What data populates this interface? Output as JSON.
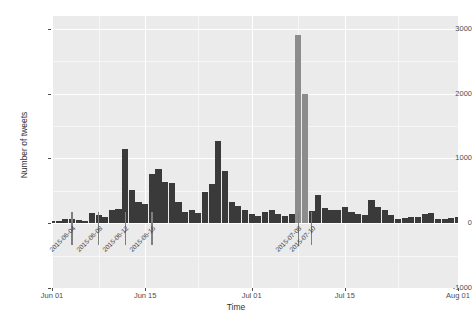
{
  "chart_data": {
    "type": "bar",
    "title": "",
    "subtitle": "",
    "xlabel": "Time",
    "ylabel": "Number of tweets",
    "grid": true,
    "legend": "none",
    "xlim": [
      "2015-06-01",
      "2015-08-01"
    ],
    "ylim": [
      -1000,
      3200
    ],
    "y_ticks": [
      3000,
      2000,
      1000,
      0,
      -1000
    ],
    "y_tick_labels": [
      "3000",
      "2000",
      "1000",
      "0",
      "-1000"
    ],
    "x_ticks": [
      "2015-06-01",
      "2015-06-15",
      "2015-07-01",
      "2015-07-15",
      "2015-08-01"
    ],
    "x_tick_labels": [
      "Jun 01",
      "Jun 15",
      "Jul 01",
      "Jul 15",
      "Aug 01"
    ],
    "bar_color": "#3a3a3a",
    "panel_color": "#ebebeb",
    "grid_color": "#ffffff",
    "categories": [
      "2015-06-01",
      "2015-06-02",
      "2015-06-03",
      "2015-06-04",
      "2015-06-05",
      "2015-06-06",
      "2015-06-07",
      "2015-06-08",
      "2015-06-09",
      "2015-06-10",
      "2015-06-11",
      "2015-06-12",
      "2015-06-13",
      "2015-06-14",
      "2015-06-15",
      "2015-06-16",
      "2015-06-17",
      "2015-06-18",
      "2015-06-19",
      "2015-06-20",
      "2015-06-21",
      "2015-06-22",
      "2015-06-23",
      "2015-06-24",
      "2015-06-25",
      "2015-06-26",
      "2015-06-27",
      "2015-06-28",
      "2015-06-29",
      "2015-06-30",
      "2015-07-01",
      "2015-07-02",
      "2015-07-03",
      "2015-07-04",
      "2015-07-05",
      "2015-07-06",
      "2015-07-07",
      "2015-07-08",
      "2015-07-09",
      "2015-07-10",
      "2015-07-11",
      "2015-07-12",
      "2015-07-13",
      "2015-07-14",
      "2015-07-15",
      "2015-07-16",
      "2015-07-17",
      "2015-07-18",
      "2015-07-19",
      "2015-07-20",
      "2015-07-21",
      "2015-07-22",
      "2015-07-23",
      "2015-07-24",
      "2015-07-25",
      "2015-07-26",
      "2015-07-27",
      "2015-07-28",
      "2015-07-29",
      "2015-07-30",
      "2015-07-31",
      "2015-08-01"
    ],
    "values": [
      30,
      35,
      60,
      70,
      55,
      40,
      160,
      130,
      95,
      200,
      220,
      1140,
      520,
      330,
      290,
      760,
      840,
      640,
      620,
      330,
      180,
      200,
      160,
      480,
      600,
      1270,
      800,
      330,
      260,
      210,
      150,
      110,
      180,
      200,
      140,
      110,
      150,
      2900,
      2000,
      195,
      440,
      230,
      200,
      210,
      250,
      170,
      140,
      120,
      360,
      250,
      200,
      120,
      70,
      80,
      100,
      90,
      150,
      155,
      60,
      70,
      80,
      90
    ],
    "annotations": [
      {
        "date": "2015-06-04",
        "label": "2015-06-04",
        "line_top_value": 180,
        "line_bottom_value": -330
      },
      {
        "date": "2015-06-08",
        "label": "2015-06-08",
        "line_top_value": 180,
        "line_bottom_value": -330
      },
      {
        "date": "2015-06-12",
        "label": "2015-06-12",
        "line_top_value": 180,
        "line_bottom_value": -330
      },
      {
        "date": "2015-06-16",
        "label": "2015-06-16",
        "line_top_value": 180,
        "line_bottom_value": -330
      },
      {
        "date": "2015-07-08",
        "label": "2015-07-08",
        "line_top_value": 180,
        "line_bottom_value": -330
      },
      {
        "date": "2015-07-10",
        "label": "2015-07-10",
        "line_top_value": 180,
        "line_bottom_value": -330
      }
    ],
    "highlight_bars": [
      {
        "date": "2015-07-08",
        "value": 2900,
        "color": "#8c8c8c"
      },
      {
        "date": "2015-07-09",
        "value": 2000,
        "color": "#8c8c8c"
      }
    ]
  }
}
